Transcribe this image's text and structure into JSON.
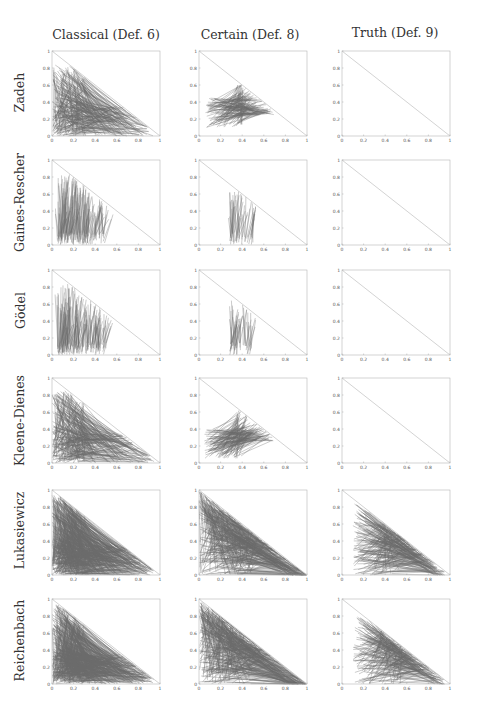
{
  "figure": {
    "columns": [
      {
        "title": "Classical (Def. 6)"
      },
      {
        "title": "Certain (Def. 8)"
      },
      {
        "title": "Truth (Def. 9)"
      }
    ],
    "rows": [
      {
        "label": "Zadeh"
      },
      {
        "label": "Gaines-Rescher"
      },
      {
        "label": "Gödel"
      },
      {
        "label": "Kleene-Dienes"
      },
      {
        "label": "Lukasiewicz"
      },
      {
        "label": "Reichenbach"
      }
    ],
    "axis": {
      "x_ticks": [
        "0",
        "0.2",
        "0.4",
        "0.6",
        "0.8",
        "1"
      ],
      "y_ticks": [
        "0",
        "0.2",
        "0.4",
        "0.6",
        "0.8",
        "1"
      ]
    }
  },
  "chart_data": {
    "type": "line",
    "title": "",
    "layout": "grid 6 rows x 3 columns of small multiples",
    "xlabel": "",
    "ylabel": "",
    "xlim": [
      0,
      1
    ],
    "ylim": [
      0,
      1
    ],
    "grid": false,
    "legend": "none",
    "column_titles": [
      "Classical (Def. 6)",
      "Certain (Def. 8)",
      "Truth (Def. 9)"
    ],
    "row_labels": [
      "Zadeh",
      "Gaines-Rescher",
      "Gödel",
      "Kleene-Dienes",
      "Lukasiewicz",
      "Reichenbach"
    ],
    "x_ticks": [
      0,
      0.2,
      0.4,
      0.6,
      0.8,
      1
    ],
    "y_ticks": [
      0,
      0.2,
      0.4,
      0.6,
      0.8,
      1
    ],
    "reference_line": {
      "from": [
        0,
        1
      ],
      "to": [
        1,
        0
      ],
      "description": "diagonal x + y = 1 in every panel"
    },
    "panels": [
      {
        "row": "Zadeh",
        "col": "Classical (Def. 6)",
        "content": "dense segments",
        "x_range": [
          0,
          0.95
        ],
        "y_range": [
          0,
          0.85
        ]
      },
      {
        "row": "Zadeh",
        "col": "Certain (Def. 8)",
        "content": "segments clustered",
        "x_range": [
          0.05,
          0.7
        ],
        "y_range": [
          0.1,
          0.65
        ]
      },
      {
        "row": "Zadeh",
        "col": "Truth (Def. 9)",
        "content": "empty"
      },
      {
        "row": "Gaines-Rescher",
        "col": "Classical (Def. 6)",
        "content": "near-vertical segments",
        "x_range": [
          0.05,
          0.5
        ],
        "y_range": [
          0,
          0.85
        ]
      },
      {
        "row": "Gaines-Rescher",
        "col": "Certain (Def. 8)",
        "content": "near-vertical segments",
        "x_range": [
          0.28,
          0.5
        ],
        "y_range": [
          0,
          0.65
        ]
      },
      {
        "row": "Gaines-Rescher",
        "col": "Truth (Def. 9)",
        "content": "empty"
      },
      {
        "row": "Gödel",
        "col": "Classical (Def. 6)",
        "content": "near-vertical segments",
        "x_range": [
          0.05,
          0.5
        ],
        "y_range": [
          0,
          0.85
        ]
      },
      {
        "row": "Gödel",
        "col": "Certain (Def. 8)",
        "content": "near-vertical segments",
        "x_range": [
          0.28,
          0.5
        ],
        "y_range": [
          0,
          0.65
        ]
      },
      {
        "row": "Gödel",
        "col": "Truth (Def. 9)",
        "content": "empty"
      },
      {
        "row": "Kleene-Dienes",
        "col": "Classical (Def. 6)",
        "content": "dense segments",
        "x_range": [
          0,
          0.95
        ],
        "y_range": [
          0,
          0.85
        ]
      },
      {
        "row": "Kleene-Dienes",
        "col": "Certain (Def. 8)",
        "content": "segments clustered",
        "x_range": [
          0.05,
          0.7
        ],
        "y_range": [
          0.05,
          0.65
        ]
      },
      {
        "row": "Kleene-Dienes",
        "col": "Truth (Def. 9)",
        "content": "empty"
      },
      {
        "row": "Lukasiewicz",
        "col": "Classical (Def. 6)",
        "content": "fully filled triangle",
        "x_range": [
          0,
          0.95
        ],
        "y_range": [
          0,
          0.95
        ]
      },
      {
        "row": "Lukasiewicz",
        "col": "Certain (Def. 8)",
        "content": "filled triangle, radiating",
        "x_range": [
          0,
          0.95
        ],
        "y_range": [
          0,
          0.9
        ]
      },
      {
        "row": "Lukasiewicz",
        "col": "Truth (Def. 9)",
        "content": "segments toward diagonal",
        "x_range": [
          0.1,
          0.95
        ],
        "y_range": [
          0,
          0.85
        ]
      },
      {
        "row": "Reichenbach",
        "col": "Classical (Def. 6)",
        "content": "fully filled triangle",
        "x_range": [
          0,
          0.95
        ],
        "y_range": [
          0,
          0.95
        ]
      },
      {
        "row": "Reichenbach",
        "col": "Certain (Def. 8)",
        "content": "filled triangle, radiating",
        "x_range": [
          0,
          0.95
        ],
        "y_range": [
          0,
          0.9
        ]
      },
      {
        "row": "Reichenbach",
        "col": "Truth (Def. 9)",
        "content": "segments toward diagonal",
        "x_range": [
          0.1,
          0.9
        ],
        "y_range": [
          0,
          0.8
        ]
      }
    ]
  }
}
